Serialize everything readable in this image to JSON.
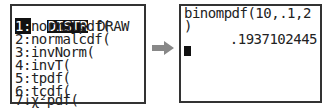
{
  "left_screen": {
    "tabs": [
      {
        "label": "DISTR",
        "selected": true
      },
      {
        "label": "DRAW",
        "selected": false
      }
    ],
    "menu_items": [
      {
        "key": "1",
        "sep": ":",
        "label": "normalpdf(",
        "selected": true
      },
      {
        "key": "2",
        "sep": ":",
        "label": "normalcdf(",
        "selected": false
      },
      {
        "key": "3",
        "sep": ":",
        "label": "invNorm(",
        "selected": false
      },
      {
        "key": "4",
        "sep": ":",
        "label": "invT(",
        "selected": false
      },
      {
        "key": "5",
        "sep": ":",
        "label": "tpdf(",
        "selected": false
      },
      {
        "key": "6",
        "sep": ":",
        "label": "tcdf(",
        "selected": false
      },
      {
        "key": "7",
        "sep": "↓",
        "label": "χ²pdf(",
        "selected": false
      }
    ]
  },
  "arrow": {
    "icon": "right-arrow-icon",
    "color": "#888888"
  },
  "right_screen": {
    "input_line1": "binompdf(10,.1,2",
    "input_line2": ")",
    "result": ".1937102445",
    "cursor": "block-cursor"
  }
}
